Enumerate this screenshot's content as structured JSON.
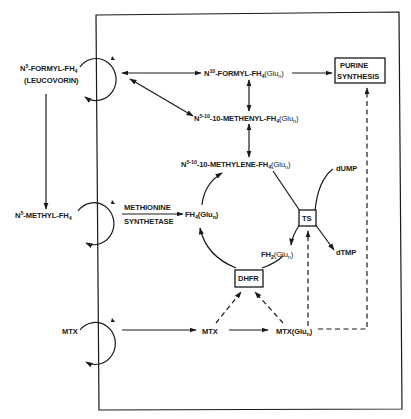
{
  "diagram": {
    "cell_membrane": {
      "left": 98,
      "top": 15,
      "right": 401,
      "bottom": 409
    },
    "extracellular": {
      "leucovorin": {
        "line1_main": "N",
        "line1_sup": "5",
        "line1_rest": "-FORMYL-FH",
        "line1_sub": "4",
        "line2": "(LEUCOVORIN)"
      },
      "methyl_fh4": {
        "main": "N",
        "sup": "5",
        "rest": "-METHYL-FH",
        "sub": "4"
      },
      "mtx": "MTX"
    },
    "intracellular": {
      "formyl": {
        "main": "N",
        "sup": "10",
        "rest": "-FORMYL-FH",
        "sub": "4",
        "tail": "(Glu",
        "tail_sub": "n",
        "tail_end": ")"
      },
      "methenyl": {
        "main": "N",
        "sup": "5-10",
        "rest": "-10-METHENYL-FH",
        "sub": "4",
        "tail": "(Glu",
        "tail_sub": "n",
        "tail_end": ")"
      },
      "methylene": {
        "main": "N",
        "sup": "5-10",
        "rest": "-10-METHYLENE-FH",
        "sub": "4",
        "tail": "(Glu",
        "tail_sub": "n",
        "tail_end": ")"
      },
      "fh4": {
        "main": "FH",
        "sub": "4",
        "tail": "(Glu",
        "tail_sub": "n",
        "tail_end": ")"
      },
      "fh2": {
        "main": "FH",
        "sub": "2",
        "tail": "(Glu",
        "tail_sub": "n",
        "tail_end": ")"
      },
      "methionine_synthetase": {
        "line1": "METHIONINE",
        "line2": "SYNTHETASE"
      },
      "purine_synthesis": {
        "line1": "PURINE",
        "line2": "SYNTHESIS"
      },
      "ts": "TS",
      "dhfr": "DHFR",
      "dump": "dUMP",
      "dtmp": "dTMP",
      "mtx": "MTX",
      "mtx_glu": {
        "main": "MTX(Glu",
        "sub": "n",
        "end": ")"
      }
    }
  }
}
